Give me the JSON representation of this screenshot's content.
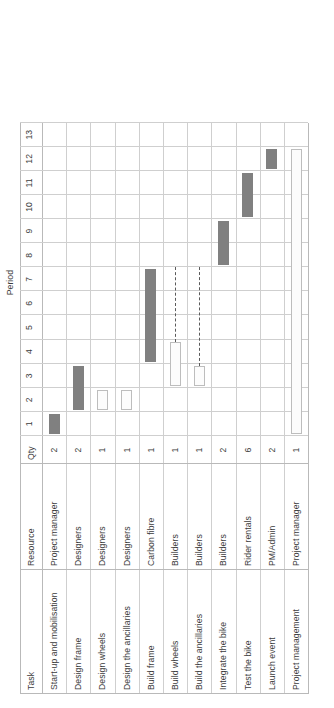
{
  "chart_data": {
    "type": "bar",
    "subtype": "gantt",
    "title": "",
    "xlabel": "",
    "ylabel": "Period",
    "axis_title": "Period",
    "periods": [
      1,
      2,
      3,
      4,
      5,
      6,
      7,
      8,
      9,
      10,
      11,
      12,
      13
    ],
    "period_min": 1,
    "period_max": 13,
    "columns": [
      "Task",
      "Resource",
      "Qty"
    ],
    "grid": true,
    "legend_position": "right",
    "colors": {
      "solid_bar": "#808080",
      "hollow_bar": "#fcfcfc",
      "hollow_border": "#bdbdbd",
      "gridline": "#b9b9b9",
      "dependency_line": "#5a5a5a",
      "text": "#3c3c3c"
    },
    "legend": [
      {
        "name": "solid-bar-swatch",
        "style": "solid",
        "label": ""
      },
      {
        "name": "hollow-bar-swatch",
        "style": "hollow",
        "label": ""
      },
      {
        "name": "dependency-line-swatch",
        "style": "dashed",
        "label": ""
      }
    ],
    "rows": [
      {
        "task": "Start-up and mobilisation",
        "resource": "Project manager",
        "qty": "2",
        "start": 1,
        "end": 2,
        "style": "solid"
      },
      {
        "task": "Design frame",
        "resource": "Designers",
        "qty": "2",
        "start": 2,
        "end": 4,
        "style": "solid"
      },
      {
        "task": "Design wheels",
        "resource": "Designers",
        "qty": "1",
        "start": 2,
        "end": 3,
        "style": "hollow"
      },
      {
        "task": "Design the ancillaries",
        "resource": "Designers",
        "qty": "1",
        "start": 2,
        "end": 3,
        "style": "hollow"
      },
      {
        "task": "Build frame",
        "resource": "Carbon fibre",
        "qty": "1",
        "start": 4,
        "end": 8,
        "style": "solid"
      },
      {
        "task": "Build wheels",
        "resource": "Builders",
        "qty": "1",
        "start": 3,
        "end": 5,
        "style": "hollow"
      },
      {
        "task": "Build the ancillaries",
        "resource": "Builders",
        "qty": "1",
        "start": 3,
        "end": 4,
        "style": "hollow"
      },
      {
        "task": "Integrate the bike",
        "resource": "Builders",
        "qty": "2",
        "start": 8,
        "end": 10,
        "style": "solid"
      },
      {
        "task": "Test the bike",
        "resource": "Rider rentals",
        "qty": "6",
        "start": 10,
        "end": 12,
        "style": "solid"
      },
      {
        "task": "Launch event",
        "resource": "PM/Admin",
        "qty": "2",
        "start": 12,
        "end": 13,
        "style": "solid"
      },
      {
        "task": "Project management",
        "resource": "Project manager",
        "qty": "1",
        "start": 1,
        "end": 13,
        "style": "hollow"
      }
    ],
    "dependencies": [
      {
        "from_row": 5,
        "to_period": 8,
        "from_period": 5
      },
      {
        "from_row": 6,
        "to_period": 8,
        "from_period": 4
      }
    ]
  }
}
